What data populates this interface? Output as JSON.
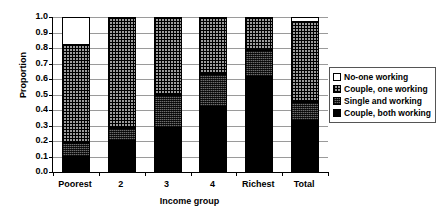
{
  "chart_data": {
    "type": "bar",
    "subtype": "stacked-vertical-100pct",
    "title": "",
    "xlabel": "Income group",
    "ylabel": "Proportion",
    "ylim": [
      0.0,
      1.0
    ],
    "ytick_labels": [
      "1.0",
      "0.9",
      "0.8",
      "0.7",
      "0.6",
      "0.5",
      "0.4",
      "0.3",
      "0.2",
      "0.1",
      "0.0"
    ],
    "ytick_values": [
      1.0,
      0.9,
      0.8,
      0.7,
      0.6,
      0.5,
      0.4,
      0.3,
      0.2,
      0.1,
      0.0
    ],
    "grid": true,
    "grid_axis": "y",
    "legend_position": "right",
    "categories": [
      "Poorest",
      "2",
      "3",
      "4",
      "Richest",
      "Total"
    ],
    "series": [
      {
        "name": "Couple, both working",
        "fill": "solid-black",
        "color": "#000000",
        "values": [
          0.1,
          0.2,
          0.285,
          0.42,
          0.61,
          0.33
        ]
      },
      {
        "name": "Single and working",
        "fill": "dark-speckle",
        "color": "#6d6d6d",
        "values": [
          0.09,
          0.085,
          0.215,
          0.21,
          0.18,
          0.12
        ]
      },
      {
        "name": "Couple, one working",
        "fill": "cross-hatch",
        "color": "#9c9c9c",
        "values": [
          0.63,
          0.715,
          0.5,
          0.37,
          0.21,
          0.52
        ]
      },
      {
        "name": "No-one working",
        "fill": "white",
        "color": "#ffffff",
        "values": [
          0.18,
          0.0,
          0.0,
          0.0,
          0.0,
          0.03
        ]
      }
    ],
    "cumulative_tops": {
      "Poorest": [
        0.1,
        0.19,
        0.82,
        1.0
      ],
      "2": [
        0.2,
        0.285,
        1.0,
        1.0
      ],
      "3": [
        0.285,
        0.5,
        1.0,
        1.0
      ],
      "4": [
        0.42,
        0.63,
        1.0,
        1.0
      ],
      "Richest": [
        0.61,
        0.79,
        1.0,
        1.0
      ],
      "Total": [
        0.33,
        0.45,
        0.97,
        1.0
      ]
    }
  },
  "legend": {
    "entries": [
      {
        "label": "No-one working"
      },
      {
        "label": "Couple, one working"
      },
      {
        "label": "Single and working"
      },
      {
        "label": "Couple, both working"
      }
    ]
  }
}
